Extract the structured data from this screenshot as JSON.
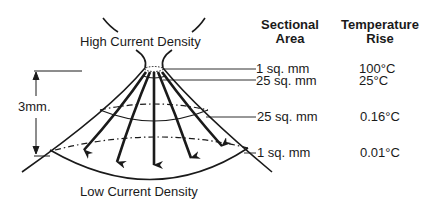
{
  "labels": {
    "top": "High Current Density",
    "bottom": "Low Current Density",
    "dimension": "3mm."
  },
  "table": {
    "headers": {
      "area_line1": "Sectional",
      "area_line2": "Area",
      "temp_line1": "Temperature",
      "temp_line2": "Rise"
    },
    "rows": [
      {
        "area": "1 sq. mm",
        "temp": "100°C"
      },
      {
        "area": "25 sq. mm",
        "temp": "25°C"
      },
      {
        "area": "25 sq. mm",
        "temp": "0.16°C"
      },
      {
        "area": "1 sq. mm",
        "temp": "0.01°C"
      }
    ]
  },
  "colors": {
    "ink": "#1a1a1a",
    "background": "#ffffff"
  }
}
